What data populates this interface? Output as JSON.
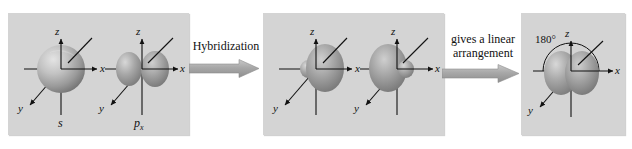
{
  "figure": {
    "background_color": "#ffffff",
    "panel_color": "#d4d4d4",
    "orbital_color": "#8c8c8c",
    "axis_color": "#111111"
  },
  "panels": [
    {
      "id": "panel-reactants",
      "orbitals": [
        {
          "name": "s-orbital",
          "label": "s",
          "shape": "sphere",
          "axes": [
            {
              "name": "z",
              "label": "z"
            },
            {
              "name": "x",
              "label": "x"
            },
            {
              "name": "y",
              "label": "y"
            }
          ]
        },
        {
          "name": "p-orbital",
          "label": "p",
          "label_subscript": "x",
          "shape": "two-lobe",
          "axes": [
            {
              "name": "z",
              "label": "z"
            },
            {
              "name": "x",
              "label": "x"
            },
            {
              "name": "y",
              "label": "y"
            }
          ]
        }
      ]
    },
    {
      "id": "panel-hybrids",
      "orbitals": [
        {
          "name": "sp-hybrid-orbital-right",
          "label": "",
          "shape": "sp-hybrid-right",
          "axes": [
            {
              "name": "z",
              "label": "z"
            },
            {
              "name": "x",
              "label": "x"
            },
            {
              "name": "y",
              "label": "y"
            }
          ]
        },
        {
          "name": "sp-hybrid-orbital-left",
          "label": "",
          "shape": "sp-hybrid-left",
          "axes": [
            {
              "name": "z",
              "label": "z"
            },
            {
              "name": "x",
              "label": "x"
            },
            {
              "name": "y",
              "label": "y"
            }
          ]
        }
      ]
    },
    {
      "id": "panel-linear",
      "angle_label": "180°",
      "orbitals": [
        {
          "name": "linear-sp-orbitals",
          "label": "",
          "shape": "two-sp-lobes",
          "axes": [
            {
              "name": "z",
              "label": "z"
            },
            {
              "name": "x",
              "label": "x"
            },
            {
              "name": "y",
              "label": "y"
            }
          ]
        }
      ]
    }
  ],
  "steps": [
    {
      "id": "step-hybridization",
      "caption_lines": [
        "Hybridization"
      ],
      "arrow": "right-arrow"
    },
    {
      "id": "step-linear",
      "caption_lines": [
        "gives a linear",
        "arrangement"
      ],
      "arrow": "right-arrow"
    }
  ]
}
